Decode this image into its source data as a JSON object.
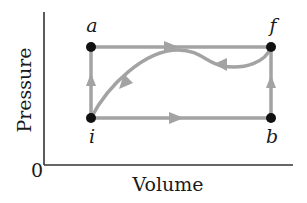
{
  "diagram": {
    "type": "PV diagram",
    "axes": {
      "x_label": "Volume",
      "y_label": "Pressure",
      "origin_label": "0"
    },
    "points": [
      {
        "id": "a",
        "label": "a",
        "x": 91,
        "y": 47
      },
      {
        "id": "f",
        "label": "f",
        "x": 271,
        "y": 47
      },
      {
        "id": "i",
        "label": "i",
        "x": 91,
        "y": 118
      },
      {
        "id": "b",
        "label": "b",
        "x": 271,
        "y": 118
      }
    ],
    "paths": [
      {
        "name": "i-to-a",
        "from": "i",
        "to": "a",
        "direction": "up"
      },
      {
        "name": "a-to-f",
        "from": "a",
        "to": "f",
        "direction": "right"
      },
      {
        "name": "i-to-b",
        "from": "i",
        "to": "b",
        "direction": "right"
      },
      {
        "name": "b-to-f",
        "from": "b",
        "to": "f",
        "direction": "up"
      },
      {
        "name": "f-to-i-curve",
        "from": "f",
        "to": "i",
        "direction": "curved back"
      }
    ],
    "colors": {
      "path": "#a3a3a3",
      "point": "#111111",
      "axis": "#333333",
      "text": "#1a1a1a"
    }
  }
}
